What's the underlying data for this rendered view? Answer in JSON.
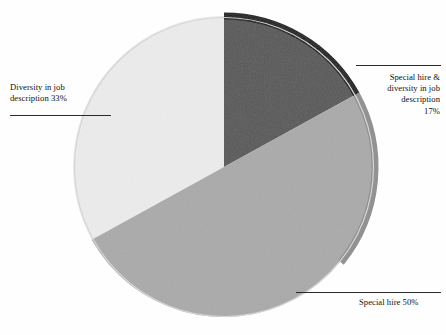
{
  "chart_data": {
    "type": "pie",
    "title": "",
    "subtitle": "",
    "xlabel": "",
    "ylabel": "",
    "grid": false,
    "legend_position": "none",
    "labels_position": "outside-with-leader-lines",
    "start_angle_deg": 0,
    "direction": "clockwise",
    "categories": [
      "Special hire & diversity in job description",
      "Special hire",
      "Diversity in job description"
    ],
    "values": [
      17,
      50,
      33
    ],
    "value_unit": "%",
    "colors": [
      "#585858",
      "#aaaaaa",
      "#ececec"
    ],
    "slices": [
      {
        "name": "Special hire & diversity in job description",
        "value": 17,
        "display": "17%",
        "color": "#585858",
        "label_text": "Special hire &\ndiversity in job\ndescription\n17%",
        "label_align": "right"
      },
      {
        "name": "Special hire",
        "value": 50,
        "display": "50%",
        "color": "#aaaaaa",
        "label_text": "Special hire 50%",
        "label_align": "left"
      },
      {
        "name": "Diversity in job description",
        "value": 33,
        "display": "33%",
        "color": "#ececec",
        "label_text": "Diversity in job\ndescription 33%",
        "label_align": "left"
      }
    ]
  },
  "figure": {
    "background_color": "#ffffff",
    "rim_color": "#141414",
    "shadow_rim_color": "#8f8f8f",
    "leader_line_color": "#2b2b2b",
    "center_x": 224,
    "center_y": 167,
    "radius": 151
  },
  "labels": {
    "diversity": "Diversity in job\ndescription 33%",
    "special_hire_and_diversity": "Special hire &\ndiversity in job\ndescription\n17%",
    "special_hire": "Special hire 50%"
  }
}
